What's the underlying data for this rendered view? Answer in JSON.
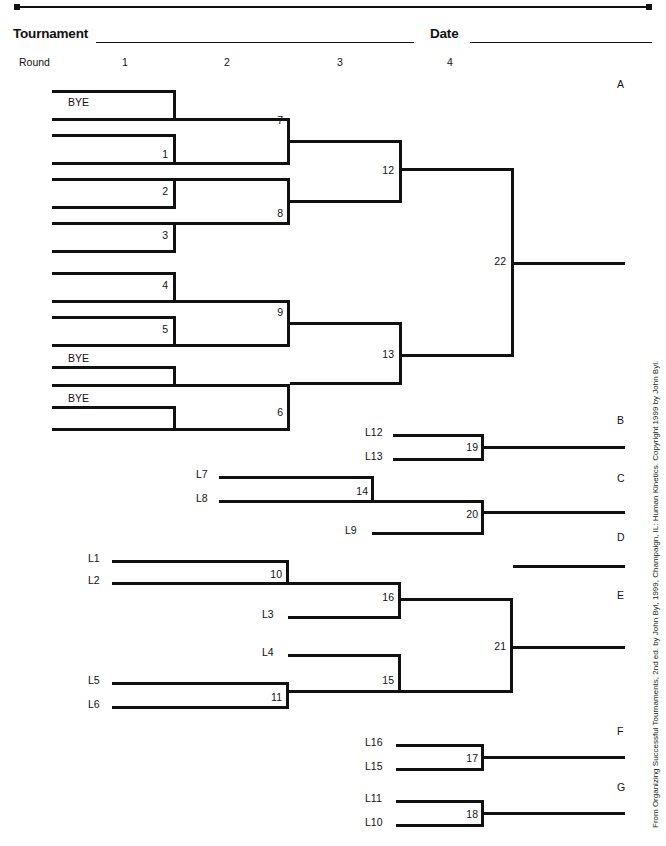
{
  "header": {
    "tournament_label": "Tournament",
    "date_label": "Date",
    "round_label": "Round",
    "rounds": [
      "1",
      "2",
      "3",
      "4"
    ]
  },
  "credit": "From Organizing Successful Tournaments, 2nd ed. by John Byl, 1999, Champaign, IL: Human Kinetics. Copyright 1999 by John Byl.",
  "colors": {
    "ink": "#111111",
    "shadow": "#b8b8b8",
    "paper": "#ffffff"
  },
  "output_letters": [
    "A",
    "B",
    "C",
    "D",
    "E",
    "F",
    "G"
  ],
  "winners_bracket": {
    "round1_entries": [
      "BYE",
      "",
      "",
      "",
      "",
      "",
      "",
      "",
      "",
      "",
      "BYE",
      "",
      "BYE",
      "",
      "",
      ""
    ],
    "round1_games": [
      "BYE",
      "1",
      "2",
      "3",
      "4",
      "5",
      "BYE",
      "BYE"
    ],
    "round1_game_numbers": [
      "",
      "1",
      "2",
      "3",
      "4",
      "5",
      "",
      ""
    ],
    "round2_games": [
      "7",
      "8",
      "9",
      "6"
    ],
    "round3_games": [
      "12",
      "13"
    ],
    "round4_games": [
      "22"
    ]
  },
  "losers_bracket": {
    "feeders": [
      "L12",
      "L13",
      "L7",
      "L8",
      "L9",
      "L1",
      "L2",
      "L3",
      "L4",
      "L5",
      "L6",
      "L16",
      "L15",
      "L11",
      "L10"
    ],
    "games": [
      "19",
      "14",
      "20",
      "10",
      "16",
      "15",
      "11",
      "21",
      "17",
      "18"
    ],
    "game_19": {
      "label": "19",
      "inputs": [
        "L12",
        "L13"
      ]
    },
    "game_14": {
      "label": "14",
      "inputs": [
        "L7",
        "L8"
      ]
    },
    "game_20": {
      "label": "20",
      "inputs": [
        "14",
        "L9"
      ]
    },
    "game_10": {
      "label": "10",
      "inputs": [
        "L1",
        "L2"
      ]
    },
    "game_16": {
      "label": "16",
      "inputs": [
        "10",
        "L3"
      ]
    },
    "game_15": {
      "label": "15",
      "inputs": [
        "L4",
        "11"
      ]
    },
    "game_11": {
      "label": "11",
      "inputs": [
        "L5",
        "L6"
      ]
    },
    "game_21": {
      "label": "21",
      "inputs": [
        "16",
        "15"
      ]
    },
    "game_17": {
      "label": "17",
      "inputs": [
        "L16",
        "L15"
      ]
    },
    "game_18": {
      "label": "18",
      "inputs": [
        "L11",
        "L10"
      ]
    }
  },
  "labels": {
    "bye": "BYE",
    "g1": "1",
    "g2": "2",
    "g3": "3",
    "g4": "4",
    "g5": "5",
    "g6": "6",
    "g7": "7",
    "g8": "8",
    "g9": "9",
    "g10": "10",
    "g11": "11",
    "g12": "12",
    "g13": "13",
    "g14": "14",
    "g15": "15",
    "g16": "16",
    "g17": "17",
    "g18": "18",
    "g19": "19",
    "g20": "20",
    "g21": "21",
    "g22": "22",
    "L1": "L1",
    "L2": "L2",
    "L3": "L3",
    "L4": "L4",
    "L5": "L5",
    "L6": "L6",
    "L7": "L7",
    "L8": "L8",
    "L9": "L9",
    "L10": "L10",
    "L11": "L11",
    "L12": "L12",
    "L13": "L13",
    "L15": "L15",
    "L16": "L16",
    "A": "A",
    "B": "B",
    "C": "C",
    "D": "D",
    "E": "E",
    "F": "F",
    "G": "G",
    "bye1": "BYE",
    "bye2": "BYE",
    "bye3": "BYE",
    "r1": "1",
    "r2": "2",
    "r3": "3",
    "r4": "4"
  }
}
